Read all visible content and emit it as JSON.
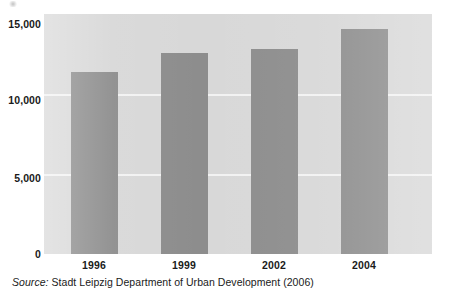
{
  "chart_data": {
    "type": "bar",
    "title": "",
    "subtitle": "",
    "xlabel": "",
    "ylabel": "",
    "categories": [
      "1996",
      "1999",
      "2002",
      "2004"
    ],
    "values": [
      11350,
      12550,
      12800,
      14050
    ],
    "series": [
      {
        "name": "",
        "values": [
          11350,
          12550,
          12800,
          14050
        ]
      }
    ],
    "ylim": [
      0,
      15000
    ],
    "ytick_labels": [
      "0",
      "5,000",
      "10,000",
      "15,000"
    ],
    "ytick_values": [
      0,
      5000,
      10000,
      15000
    ],
    "grid": true,
    "grid_axis": "y",
    "legend": "none",
    "bar_color": "#8d8d8d",
    "plot_background": "#d8d8d8",
    "gridline_color": "#f2f2f2",
    "text_color": "#1a1a1a"
  },
  "source": {
    "label": "Source:",
    "text": " Stadt Leipzig Department of Urban Development (2006)"
  }
}
